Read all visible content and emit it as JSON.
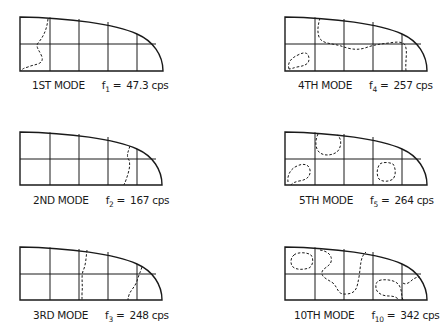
{
  "figure": {
    "units": "cps",
    "ink_color": "#1a1a1a",
    "background": "#ffffff",
    "modes": [
      {
        "name": "1ST MODE",
        "freq_symbol": "f",
        "freq_index": "1",
        "equals": "=",
        "freq_value": "47.3 cps",
        "frequency": 47.3,
        "column": "left",
        "row": 1
      },
      {
        "name": "2ND MODE",
        "freq_symbol": "f",
        "freq_index": "2",
        "equals": "=",
        "freq_value": "167 cps",
        "frequency": 167,
        "column": "left",
        "row": 2
      },
      {
        "name": "3RD MODE",
        "freq_symbol": "f",
        "freq_index": "3",
        "equals": "=",
        "freq_value": "248 cps",
        "frequency": 248,
        "column": "left",
        "row": 3
      },
      {
        "name": "4TH MODE",
        "freq_symbol": "f",
        "freq_index": "4",
        "equals": "=",
        "freq_value": "257 cps",
        "frequency": 257,
        "column": "right",
        "row": 1
      },
      {
        "name": "5TH MODE",
        "freq_symbol": "f",
        "freq_index": "5",
        "equals": "=",
        "freq_value": "264 cps",
        "frequency": 264,
        "column": "right",
        "row": 2
      },
      {
        "name": "10TH MODE",
        "freq_symbol": "f",
        "freq_index": "10",
        "equals": "=",
        "freq_value": "342 cps",
        "frequency": 342,
        "column": "right",
        "row": 3
      }
    ]
  }
}
